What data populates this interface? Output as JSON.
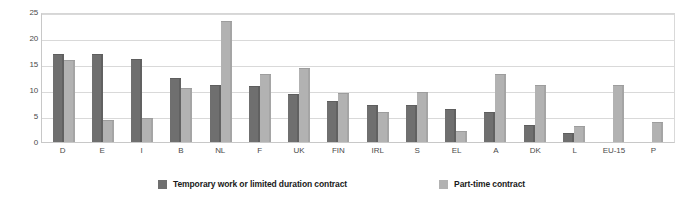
{
  "chart_data": {
    "type": "bar",
    "title": "",
    "subtitle": "",
    "xlabel": "",
    "ylabel": "",
    "ylim": [
      0,
      25
    ],
    "yticks": [
      0,
      5,
      10,
      15,
      20,
      25
    ],
    "grid": true,
    "legend_position": "bottom",
    "categories": [
      "D",
      "E",
      "I",
      "B",
      "NL",
      "F",
      "UK",
      "FIN",
      "IRL",
      "S",
      "EL",
      "A",
      "DK",
      "L",
      "EU-15",
      "P"
    ],
    "series": [
      {
        "name": "Temporary work or limited duration contract",
        "color": "#6f6f6f",
        "values": [
          17.0,
          17.0,
          16.0,
          12.3,
          10.9,
          10.8,
          9.3,
          7.8,
          7.2,
          7.2,
          6.4,
          5.8,
          3.3,
          1.7,
          null,
          null
        ]
      },
      {
        "name": "Part-time contract",
        "color": "#b2b2b2",
        "values": [
          15.7,
          4.2,
          4.7,
          10.3,
          23.3,
          13.0,
          14.3,
          9.5,
          5.8,
          9.7,
          2.2,
          13.0,
          10.9,
          3.0,
          10.9,
          3.9
        ]
      }
    ]
  },
  "axis": {
    "y_tick_labels": [
      "25",
      "20",
      "15",
      "10",
      "5",
      "0"
    ]
  },
  "legend": {
    "items": [
      {
        "label": "Temporary work or limited duration contract",
        "color": "#6f6f6f"
      },
      {
        "label": "Part-time contract",
        "color": "#b2b2b2"
      }
    ]
  }
}
